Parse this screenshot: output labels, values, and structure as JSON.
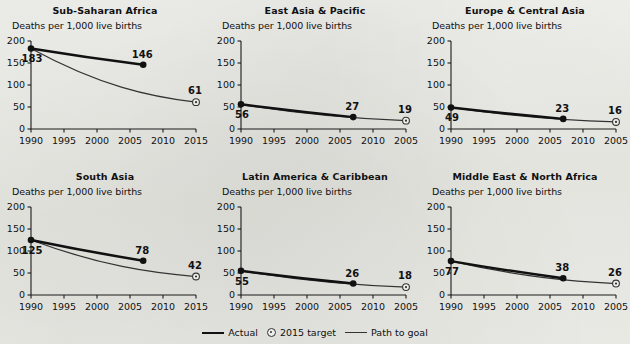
{
  "figure": {
    "axis_caption": "Deaths per 1,000 live births",
    "legend": {
      "actual_label": "Actual",
      "target_label": "2015 target",
      "path_label": "Path to goal"
    }
  },
  "chart_data": [
    {
      "type": "line",
      "title": "Sub-Saharan Africa",
      "ylabel": "Deaths per 1,000 live births",
      "xlabel": "",
      "ylim": [
        0,
        200
      ],
      "yticks": [
        0,
        50,
        100,
        150,
        200
      ],
      "xlim": [
        1990,
        2015
      ],
      "xticks": [
        1990,
        1995,
        2000,
        2005,
        2010,
        2015
      ],
      "xticklabels": [
        "1990",
        "1995",
        "2000",
        "2005",
        "2010",
        "2015"
      ],
      "grid": false,
      "series": [
        {
          "name": "Actual",
          "x": [
            1990,
            2007
          ],
          "values": [
            183,
            146
          ],
          "labels": [
            "183",
            "146"
          ]
        },
        {
          "name": "Path to goal",
          "x": [
            1990,
            2015
          ],
          "values": [
            183,
            61
          ],
          "labels": [
            "",
            "61"
          ]
        }
      ],
      "target": {
        "x": 2015,
        "value": 61,
        "label": "61"
      }
    },
    {
      "type": "line",
      "title": "East Asia & Pacific",
      "ylabel": "Deaths per 1,000 live births",
      "xlabel": "",
      "ylim": [
        0,
        200
      ],
      "yticks": [
        0,
        50,
        100,
        150,
        200
      ],
      "xlim": [
        1990,
        2015
      ],
      "xticks": [
        1990,
        1995,
        2000,
        2005,
        2010,
        2015
      ],
      "xticklabels": [
        "1990",
        "1995",
        "2000",
        "2005",
        "2010",
        "2005"
      ],
      "grid": false,
      "series": [
        {
          "name": "Actual",
          "x": [
            1990,
            2007
          ],
          "values": [
            56,
            27
          ],
          "labels": [
            "56",
            "27"
          ]
        },
        {
          "name": "Path to goal",
          "x": [
            1990,
            2015
          ],
          "values": [
            56,
            19
          ],
          "labels": [
            "",
            "19"
          ]
        }
      ],
      "target": {
        "x": 2015,
        "value": 19,
        "label": "19"
      }
    },
    {
      "type": "line",
      "title": "Europe & Central Asia",
      "ylabel": "Deaths per 1,000 live births",
      "xlabel": "",
      "ylim": [
        0,
        200
      ],
      "yticks": [
        0,
        50,
        100,
        150,
        200
      ],
      "xlim": [
        1990,
        2015
      ],
      "xticks": [
        1990,
        1995,
        2000,
        2005,
        2010,
        2015
      ],
      "xticklabels": [
        "1990",
        "1995",
        "2000",
        "2005",
        "2010",
        "2005"
      ],
      "grid": false,
      "series": [
        {
          "name": "Actual",
          "x": [
            1990,
            2007
          ],
          "values": [
            49,
            23
          ],
          "labels": [
            "49",
            "23"
          ]
        },
        {
          "name": "Path to goal",
          "x": [
            1990,
            2015
          ],
          "values": [
            49,
            16
          ],
          "labels": [
            "",
            "16"
          ]
        }
      ],
      "target": {
        "x": 2015,
        "value": 16,
        "label": "16"
      }
    },
    {
      "type": "line",
      "title": "South Asia",
      "ylabel": "Deaths per 1,000 live births",
      "xlabel": "",
      "ylim": [
        0,
        200
      ],
      "yticks": [
        0,
        50,
        100,
        150,
        200
      ],
      "xlim": [
        1990,
        2015
      ],
      "xticks": [
        1990,
        1995,
        2000,
        2005,
        2010,
        2015
      ],
      "xticklabels": [
        "1990",
        "1995",
        "2000",
        "2005",
        "2010",
        "2015"
      ],
      "grid": false,
      "series": [
        {
          "name": "Actual",
          "x": [
            1990,
            2007
          ],
          "values": [
            125,
            78
          ],
          "labels": [
            "125",
            "78"
          ]
        },
        {
          "name": "Path to goal",
          "x": [
            1990,
            2015
          ],
          "values": [
            125,
            42
          ],
          "labels": [
            "",
            "42"
          ]
        }
      ],
      "target": {
        "x": 2015,
        "value": 42,
        "label": "42"
      }
    },
    {
      "type": "line",
      "title": "Latin America & Caribbean",
      "ylabel": "Deaths per 1,000 live births",
      "xlabel": "",
      "ylim": [
        0,
        200
      ],
      "yticks": [
        0,
        50,
        100,
        150,
        200
      ],
      "xlim": [
        1990,
        2015
      ],
      "xticks": [
        1990,
        1995,
        2000,
        2005,
        2010,
        2015
      ],
      "xticklabels": [
        "1990",
        "1995",
        "2000",
        "2005",
        "2010",
        "2005"
      ],
      "grid": false,
      "series": [
        {
          "name": "Actual",
          "x": [
            1990,
            2007
          ],
          "values": [
            55,
            26
          ],
          "labels": [
            "55",
            "26"
          ]
        },
        {
          "name": "Path to goal",
          "x": [
            1990,
            2015
          ],
          "values": [
            55,
            18
          ],
          "labels": [
            "",
            "18"
          ]
        }
      ],
      "target": {
        "x": 2015,
        "value": 18,
        "label": "18"
      }
    },
    {
      "type": "line",
      "title": "Middle East & North Africa",
      "ylabel": "Deaths per 1,000 live births",
      "xlabel": "",
      "ylim": [
        0,
        200
      ],
      "yticks": [
        0,
        50,
        100,
        150,
        200
      ],
      "xlim": [
        1990,
        2015
      ],
      "xticks": [
        1990,
        1995,
        2000,
        2005,
        2010,
        2015
      ],
      "xticklabels": [
        "1990",
        "1995",
        "2000",
        "2005",
        "2010",
        "2005"
      ],
      "grid": false,
      "series": [
        {
          "name": "Actual",
          "x": [
            1990,
            2007
          ],
          "values": [
            77,
            38
          ],
          "labels": [
            "77",
            "38"
          ]
        },
        {
          "name": "Path to goal",
          "x": [
            1990,
            2015
          ],
          "values": [
            77,
            26
          ],
          "labels": [
            "",
            "26"
          ]
        }
      ],
      "target": {
        "x": 2015,
        "value": 26,
        "label": "26"
      }
    }
  ]
}
